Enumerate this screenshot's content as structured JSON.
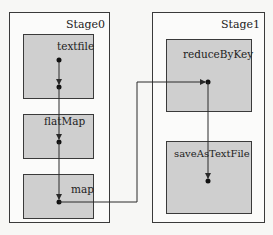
{
  "diagram": {
    "stages": [
      {
        "id": "stage0",
        "label": "Stage0"
      },
      {
        "id": "stage1",
        "label": "Stage1"
      }
    ],
    "operations": [
      {
        "id": "textfile",
        "label": "textfile",
        "stage": "stage0"
      },
      {
        "id": "flatMap",
        "label": "flatMap",
        "stage": "stage0"
      },
      {
        "id": "map",
        "label": "map",
        "stage": "stage0"
      },
      {
        "id": "reduceByKey",
        "label": "reduceByKey",
        "stage": "stage1"
      },
      {
        "id": "saveAsTextFile",
        "label": "saveAsTextFile",
        "stage": "stage1"
      }
    ],
    "edges": [
      {
        "from": "textfile",
        "to": "textfile",
        "note": "internal pipeline"
      },
      {
        "from": "textfile",
        "to": "flatMap"
      },
      {
        "from": "flatMap",
        "to": "map"
      },
      {
        "from": "map",
        "to": "reduceByKey",
        "note": "shuffle"
      },
      {
        "from": "reduceByKey",
        "to": "saveAsTextFile"
      }
    ],
    "colors": {
      "stroke": "#2a2a2a",
      "op_fill": "#cfcfcf",
      "stage_fill": "#fbfbfa"
    }
  }
}
